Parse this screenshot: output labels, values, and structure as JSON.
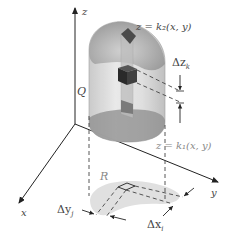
{
  "diagram": {
    "type": "triple-integral-region",
    "axes": {
      "x_label": "x",
      "y_label": "y",
      "z_label": "z"
    },
    "solid_label": "Q",
    "region_label": "R",
    "upper_surface_label": "z = k₂(x, y)",
    "lower_surface_label": "z = k₁(x, y)",
    "delta_z_label": "Δz",
    "delta_z_sub": "k",
    "delta_x_label": "Δx",
    "delta_x_sub": "i",
    "delta_y_label": "Δy",
    "delta_y_sub": "j",
    "colors": {
      "solid_fill": "#d9d9d9",
      "solid_top": "#a6a6a6",
      "solid_bottom": "#8c8c8c",
      "column_fill": "#bfbfbf",
      "cube_fill": "#333333",
      "region_fill": "#e0e0e0",
      "axis": "#222222",
      "dash": "#444444"
    }
  }
}
